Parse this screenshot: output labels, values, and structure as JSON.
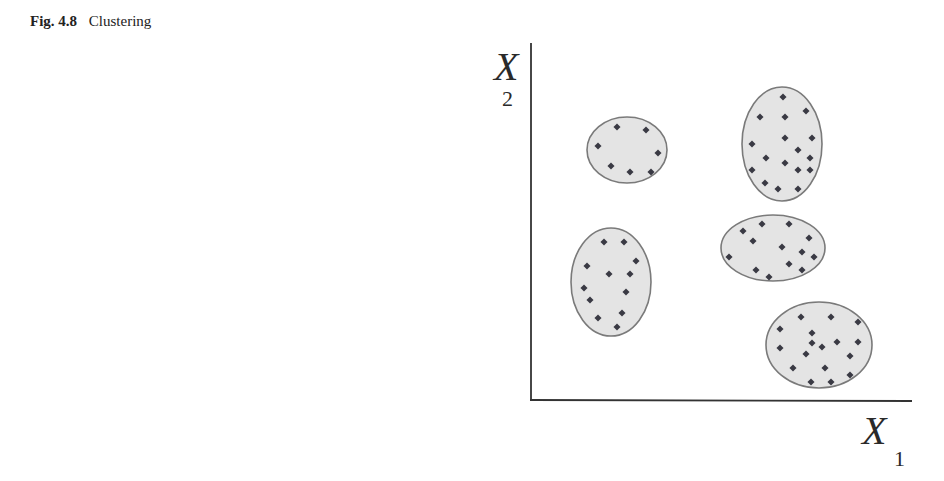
{
  "caption": {
    "figure_number": "Fig. 4.8",
    "title": "Clustering"
  },
  "axes": {
    "x_label": "X",
    "x_subscript": "1",
    "y_label": "X",
    "y_subscript": "2"
  },
  "colors": {
    "cluster_fill": "#e4e4e4",
    "cluster_stroke": "#7a7a7a",
    "point": "#3a3a44",
    "axis": "#333333"
  },
  "chart_data": {
    "type": "scatter",
    "title": "Clustering",
    "xlabel": "X1",
    "ylabel": "X2",
    "grid": false,
    "legend": null,
    "note": "Schematic: 5 clusters of points enclosed by ellipses; no numeric ticks. Coordinates in pixel space of the figure.",
    "clusters": [
      {
        "name": "cluster-top-left",
        "ellipse": {
          "cx": 627,
          "cy": 150,
          "rx": 40,
          "ry": 33
        },
        "points": [
          [
            617,
            127
          ],
          [
            646,
            130
          ],
          [
            598,
            146
          ],
          [
            658,
            153
          ],
          [
            611,
            166
          ],
          [
            630,
            172
          ],
          [
            651,
            172
          ]
        ]
      },
      {
        "name": "cluster-top-right",
        "ellipse": {
          "cx": 782,
          "cy": 144,
          "rx": 40,
          "ry": 57
        },
        "points": [
          [
            783,
            97
          ],
          [
            760,
            117
          ],
          [
            785,
            117
          ],
          [
            806,
            111
          ],
          [
            752,
            144
          ],
          [
            785,
            138
          ],
          [
            812,
            138
          ],
          [
            798,
            150
          ],
          [
            766,
            158
          ],
          [
            785,
            163
          ],
          [
            810,
            158
          ],
          [
            752,
            170
          ],
          [
            798,
            170
          ],
          [
            810,
            170
          ],
          [
            765,
            183
          ],
          [
            778,
            189
          ],
          [
            798,
            189
          ]
        ]
      },
      {
        "name": "cluster-bottom-left",
        "ellipse": {
          "cx": 611,
          "cy": 282,
          "rx": 40,
          "ry": 54
        },
        "points": [
          [
            604,
            242
          ],
          [
            624,
            242
          ],
          [
            636,
            261
          ],
          [
            587,
            266
          ],
          [
            609,
            274
          ],
          [
            630,
            274
          ],
          [
            584,
            288
          ],
          [
            626,
            292
          ],
          [
            590,
            300
          ],
          [
            622,
            313
          ],
          [
            598,
            318
          ],
          [
            617,
            327
          ]
        ]
      },
      {
        "name": "cluster-middle-right",
        "ellipse": {
          "cx": 773,
          "cy": 248,
          "rx": 52,
          "ry": 33
        },
        "points": [
          [
            762,
            224
          ],
          [
            789,
            224
          ],
          [
            743,
            231
          ],
          [
            753,
            241
          ],
          [
            809,
            238
          ],
          [
            782,
            247
          ],
          [
            802,
            252
          ],
          [
            729,
            257
          ],
          [
            814,
            257
          ],
          [
            789,
            264
          ],
          [
            756,
            270
          ],
          [
            769,
            277
          ],
          [
            802,
            270
          ]
        ]
      },
      {
        "name": "cluster-bottom-right",
        "ellipse": {
          "cx": 819,
          "cy": 345,
          "rx": 53,
          "ry": 43
        },
        "points": [
          [
            801,
            317
          ],
          [
            831,
            317
          ],
          [
            858,
            322
          ],
          [
            780,
            329
          ],
          [
            812,
            333
          ],
          [
            812,
            343
          ],
          [
            837,
            342
          ],
          [
            858,
            342
          ],
          [
            822,
            347
          ],
          [
            780,
            348
          ],
          [
            806,
            354
          ],
          [
            850,
            356
          ],
          [
            793,
            368
          ],
          [
            825,
            368
          ],
          [
            850,
            375
          ],
          [
            811,
            382
          ],
          [
            831,
            382
          ]
        ]
      }
    ]
  }
}
